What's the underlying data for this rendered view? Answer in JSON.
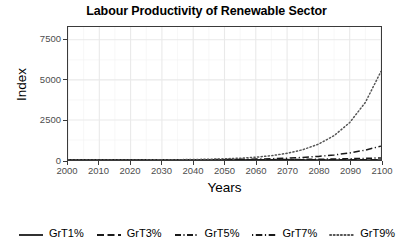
{
  "chart_data": {
    "type": "line",
    "title": "Labour Productivity of Renewable Sector",
    "xlabel": "Years",
    "ylabel": "Index",
    "xlim": [
      2000,
      2100
    ],
    "ylim": [
      0,
      8300
    ],
    "grid": true,
    "legend_position": "bottom",
    "x_ticks": [
      2000,
      2010,
      2020,
      2030,
      2040,
      2050,
      2060,
      2070,
      2080,
      2090,
      2100
    ],
    "y_ticks": [
      0,
      2500,
      5000,
      7500
    ],
    "x": [
      2000,
      2005,
      2010,
      2015,
      2020,
      2025,
      2030,
      2035,
      2040,
      2045,
      2050,
      2055,
      2060,
      2065,
      2070,
      2075,
      2080,
      2085,
      2090,
      2095,
      2100
    ],
    "series": [
      {
        "name": "GrT1%",
        "growth_rate_percent": 1,
        "dash": "solid",
        "color": "#1a1a1a",
        "values": [
          1.0,
          1.1,
          1.1,
          1.2,
          1.2,
          1.3,
          1.3,
          1.4,
          1.5,
          1.6,
          1.6,
          1.7,
          1.8,
          1.9,
          2.0,
          2.1,
          2.2,
          2.3,
          2.4,
          2.6,
          2.7
        ]
      },
      {
        "name": "GrT3%",
        "growth_rate_percent": 3,
        "dash": "dashed",
        "color": "#1a1a1a",
        "values": [
          1.0,
          1.2,
          1.3,
          1.6,
          1.8,
          2.1,
          2.4,
          2.8,
          3.3,
          3.8,
          4.4,
          5.1,
          5.9,
          6.8,
          7.9,
          9.2,
          10.6,
          12.3,
          14.3,
          16.6,
          19.2
        ]
      },
      {
        "name": "GrT5%",
        "growth_rate_percent": 5,
        "dash": "dashdot",
        "color": "#1a1a1a",
        "values": [
          1.0,
          1.3,
          1.6,
          2.1,
          2.7,
          3.4,
          4.3,
          5.5,
          7.0,
          9.0,
          11.5,
          14.6,
          18.7,
          23.8,
          30.4,
          38.8,
          49.6,
          63.3,
          80.7,
          103.0,
          131.5
        ]
      },
      {
        "name": "GrT7%",
        "growth_rate_percent": 7,
        "dash": "longdashdot",
        "color": "#1a1a1a",
        "values": [
          1.0,
          1.4,
          2.0,
          2.8,
          3.9,
          5.4,
          7.6,
          10.7,
          15.0,
          21.0,
          29.5,
          41.3,
          57.9,
          81.3,
          114.0,
          159.9,
          224.2,
          314.5,
          441.1,
          618.7,
          867.7
        ]
      },
      {
        "name": "GrT9%",
        "growth_rate_percent": 9,
        "dash": "dotted",
        "color": "#555555",
        "values": [
          1.0,
          1.5,
          2.4,
          3.6,
          5.6,
          8.6,
          13.3,
          20.4,
          31.4,
          48.3,
          74.4,
          114.4,
          176.0,
          270.8,
          416.7,
          641.1,
          986.6,
          1518.0,
          2335.5,
          3593.5,
          5529.0
        ]
      }
    ]
  },
  "legend": {
    "items": [
      {
        "label": "GrT1%"
      },
      {
        "label": "GrT3%"
      },
      {
        "label": "GrT5%"
      },
      {
        "label": "GrT7%"
      },
      {
        "label": "GrT9%"
      }
    ]
  }
}
